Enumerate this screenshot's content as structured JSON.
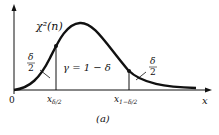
{
  "figure": {
    "curve_label": "χ²(n)",
    "gamma_label": "γ = 1 − δ",
    "left_tail_label_num": "δ",
    "left_tail_label_den": "2",
    "right_tail_label_num": "δ",
    "right_tail_label_den": "2",
    "origin_label": "0",
    "x_axis_label": "x",
    "left_quantile_label": "x",
    "left_quantile_sub": "δ/2",
    "right_quantile_label": "x",
    "right_quantile_sub": "1−δ/2",
    "caption": "(a)",
    "colors": {
      "ink": "#111111",
      "background": "#ffffff"
    }
  }
}
